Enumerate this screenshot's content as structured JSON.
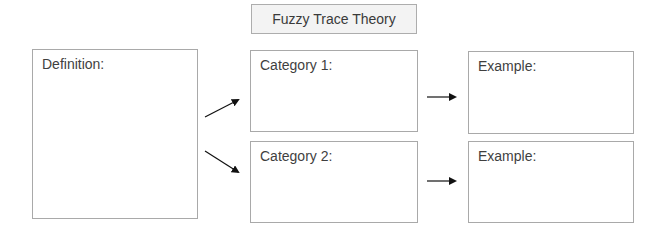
{
  "diagram": {
    "title": "Fuzzy Trace Theory",
    "definition": {
      "label": "Definition:"
    },
    "categories": [
      {
        "label": "Category 1:"
      },
      {
        "label": "Category 2:"
      }
    ],
    "examples": [
      {
        "label": "Example:"
      },
      {
        "label": "Example:"
      }
    ],
    "colors": {
      "border": "#a9a9a9",
      "title_fill": "#f3f3f3",
      "text": "#3f3f3f",
      "arrow": "#111111"
    },
    "connections": [
      {
        "from": "definition",
        "to": "category-1"
      },
      {
        "from": "definition",
        "to": "category-2"
      },
      {
        "from": "category-1",
        "to": "example-1"
      },
      {
        "from": "category-2",
        "to": "example-2"
      }
    ]
  }
}
